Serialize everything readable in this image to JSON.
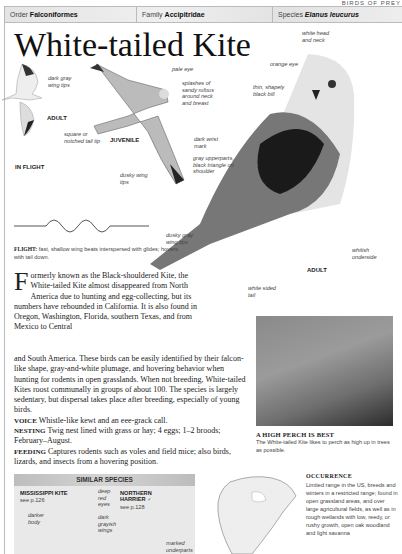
{
  "page_header": "BIRDS OF PREY",
  "taxonomy": {
    "order_label": "Order",
    "order": "Falconiformes",
    "family_label": "Family",
    "family": "Accipitridae",
    "species_label": "Species",
    "species": "Elanus leucurus"
  },
  "title": "White-tailed Kite",
  "labels": {
    "dark_wing_tips": "dark gray wing tips",
    "adult_small": "ADULT",
    "in_flight": "IN FLIGHT",
    "square_tail": "square or notched tail tip",
    "juvenile": "JUVENILE",
    "pale_eye": "pale eye",
    "splashes": "splashes of sandy rufous around neck and breast",
    "dark_wrist": "dark wrist mark",
    "dusky_wing_tips_juv": "dusky wing tips",
    "white_head": "white head and neck",
    "orange_eye": "orange eye",
    "bill": "thin, shapely black bill",
    "gray_upperparts": "gray upperparts, black triangle on shoulder",
    "dusky_gray_tips": "dusky gray wing tips",
    "whitish_underside": "whitish underside",
    "adult_large": "ADULT",
    "white_sided_tail": "white sided tail"
  },
  "flight": {
    "label": "FLIGHT:",
    "text": "fast, shallow wing beats interspersed with glides; hovers with tail down."
  },
  "intro": {
    "dropcap": "F",
    "text_narrow": "ormerly known as the Black-shouldered Kite, the White-tailed Kite almost disappeared from North America due to hunting and egg-collecting, but its numbers have rebounded in California. It is also found in Oregon, Washington, Florida, southern Texas, and from Mexico to Central",
    "text_wide": "and South America. These birds can be easily identified by their falcon-like shape, gray-and-white plumage, and hovering behavior when hunting for rodents in open grasslands. When not breeding, White-tailed Kites roost communally in groups of about 100. The species is largely sedentary, but dispersal takes place after breeding, especially of young birds."
  },
  "facts": [
    {
      "label": "VOICE",
      "text": "Whistle-like kewt and an eee-grack call."
    },
    {
      "label": "NESTING",
      "text": "Twig nest lined with grass or hay; 4 eggs; 1–2 broods; February–August."
    },
    {
      "label": "FEEDING",
      "text": "Captures rodents such as voles and field mice; also birds, lizards, and insects from a hovering position."
    }
  ],
  "photo": {
    "title": "A HIGH PERCH IS BEST",
    "caption": "The White-tailed Kite likes to perch as high up in trees as possible."
  },
  "similar_species": {
    "heading": "SIMILAR SPECIES",
    "species": [
      {
        "name": "MISSISSIPPI KITE",
        "ref": "see p.126",
        "notes": [
          "darker body",
          "deep red eyes"
        ]
      },
      {
        "name": "NORTHERN HARRIER ♂",
        "ref": "see p.128",
        "notes": [
          "dark grayish wings",
          "marked underparts"
        ]
      }
    ]
  },
  "occurrence": {
    "title": "OCCURRENCE",
    "text": "Limited range in the US, breeds and winters in a restricted range; found in open grassland areas, and over large agricultural fields, as well as in rough wetlands with low, reedy, or rushy growth, open oak woodland and light savanna"
  }
}
